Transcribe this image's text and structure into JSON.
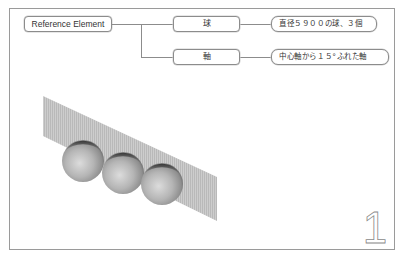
{
  "diagram": {
    "root": {
      "label": "Reference Element"
    },
    "branches": [
      {
        "label": "球",
        "description": "直径５９００の球、３個"
      },
      {
        "label": "軸",
        "description": "中心軸から１５°ふれた軸"
      }
    ]
  },
  "illustration": {
    "plane": {
      "shape": "slanted-parallelogram",
      "color": "#c4c4c4"
    },
    "spheres": {
      "count": 3,
      "color": "#b8b8b8"
    }
  },
  "page": {
    "number": "1"
  },
  "colors": {
    "frame_border": "#9a9a9a",
    "node_border": "#8c8c8c",
    "connector": "#8c8c8c",
    "text": "#333333"
  }
}
